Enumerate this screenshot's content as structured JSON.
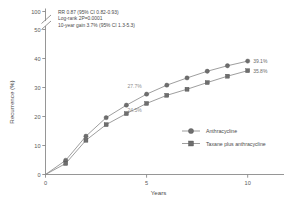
{
  "chart_data": {
    "type": "line",
    "title": "",
    "xlabel": "Years",
    "ylabel": "Recurrence (%)",
    "xlim": [
      0,
      11.5
    ],
    "ylim": [
      0,
      100
    ],
    "xticks": [
      "0",
      "5",
      "10"
    ],
    "xtick_values": [
      0,
      5,
      10
    ],
    "yticks": [
      "0",
      "10",
      "20",
      "30",
      "40",
      "50",
      "100"
    ],
    "ytick_values": [
      0,
      10,
      20,
      30,
      40,
      50,
      100
    ],
    "axis_break": true,
    "axis_break_between": [
      50,
      100
    ],
    "grid": false,
    "legend_position": "center-right",
    "x": [
      0,
      1,
      2,
      3,
      4,
      5,
      6,
      7,
      8,
      9,
      10
    ],
    "series": [
      {
        "name": "Anthracycline",
        "marker": "circle",
        "values": [
          0,
          4.9,
          13.2,
          19.6,
          23.9,
          27.7,
          30.8,
          33.3,
          35.6,
          37.5,
          39.1
        ],
        "end_label": "39.1%",
        "mid_label": "27.7%",
        "mid_label_x": 5
      },
      {
        "name": "Taxane plus anthracycline",
        "marker": "square",
        "values": [
          0,
          3.8,
          11.8,
          17.2,
          21.0,
          24.5,
          27.3,
          29.4,
          31.7,
          33.9,
          35.8
        ],
        "end_label": "35.8%",
        "mid_label": "24.5%",
        "mid_label_x": 5
      }
    ],
    "annotations": [
      "RR 0.87 (95% CI 0.82-0.93)",
      "Log-rank 2P=0.0001",
      "10-year gain 3.7% (95% CI 1.3-5.3)"
    ],
    "colors": {
      "axis": "#8a8a8a",
      "line": "#8c8c8c",
      "marker": "#6e6e6e",
      "text": "#4a4a4a",
      "value_label": "#8e8e8e"
    }
  },
  "legend": {
    "items": [
      {
        "label": "Anthracycline",
        "marker": "circle"
      },
      {
        "label": "Taxane plus anthracycline",
        "marker": "square"
      }
    ]
  }
}
